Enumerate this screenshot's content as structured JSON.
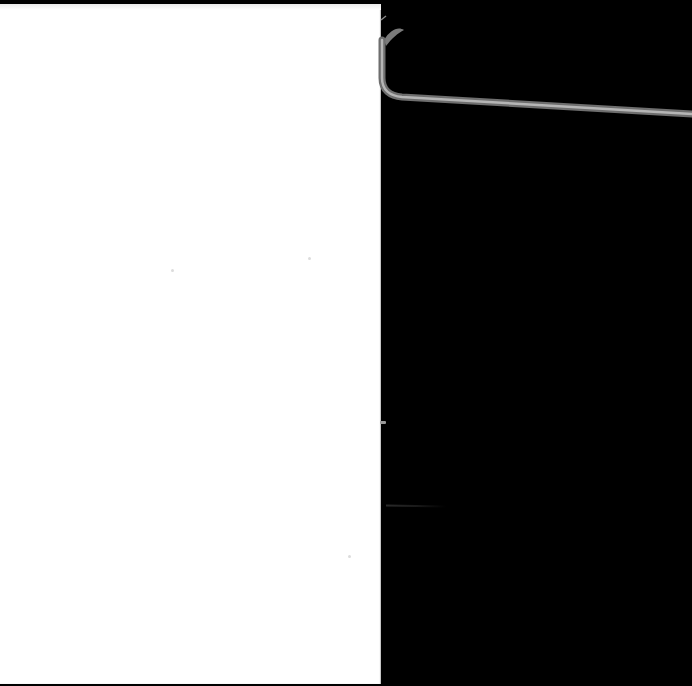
{
  "scene": {
    "description": "Blank white sheet of paper on a black background with a thin gray wire curving from its top-right corner",
    "background_color": "#000000",
    "paper_color": "#ffffff",
    "wire_color": "#8c8c8c",
    "wire_highlight_color": "#c8c8c8"
  }
}
